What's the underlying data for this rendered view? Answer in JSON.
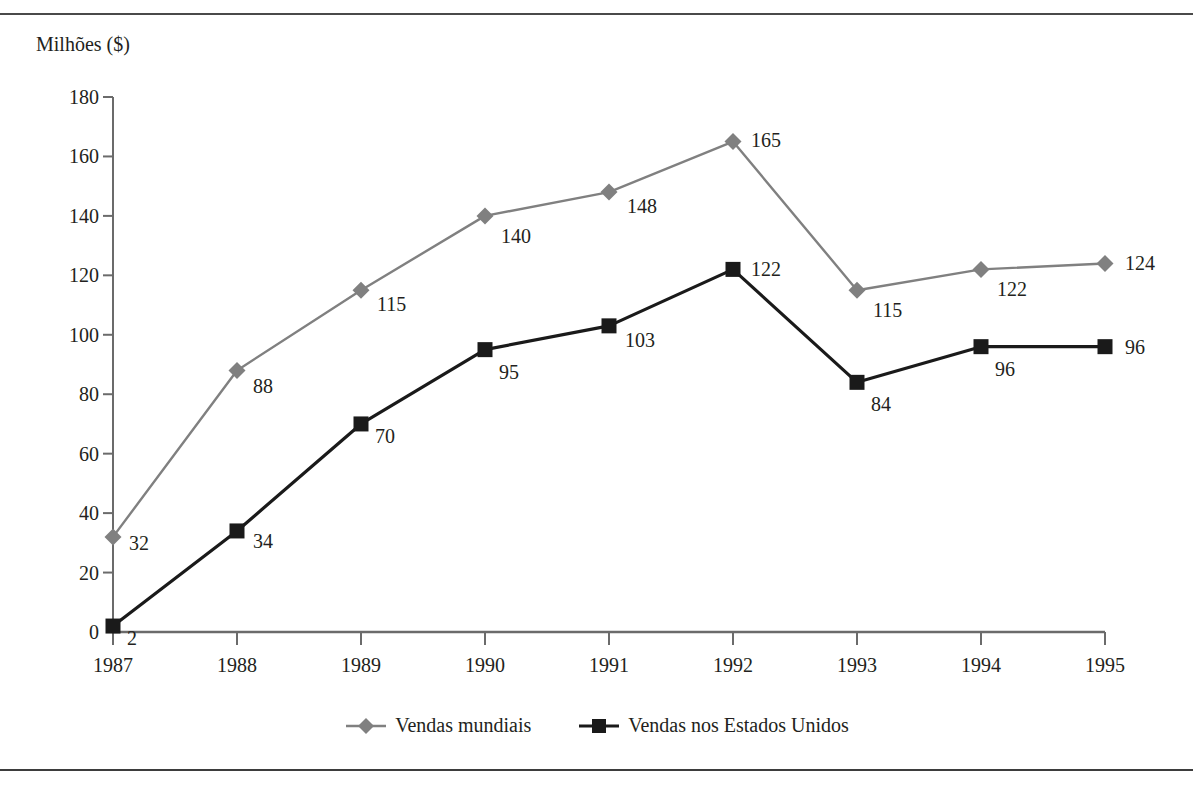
{
  "page": {
    "top_caption": "",
    "axis_title": "Milhões ($)"
  },
  "legend": {
    "items": [
      {
        "label": "Vendas mundiais",
        "marker": "diamond-marker-icon",
        "color": "#808080"
      },
      {
        "label": "Vendas nos Estados Unidos",
        "marker": "square-marker-icon",
        "color": "#1a1a1a"
      }
    ]
  },
  "chart_data": {
    "type": "line",
    "title": "",
    "xlabel": "",
    "ylabel": "Milhões ($)",
    "ylim": [
      0,
      180
    ],
    "ytick_step": 20,
    "yticks": [
      0,
      20,
      40,
      60,
      80,
      100,
      120,
      140,
      160,
      180
    ],
    "ytick_labels": [
      "0",
      "20",
      "40",
      "60",
      "80",
      "100",
      "120",
      "140",
      "160",
      "180"
    ],
    "grid": false,
    "legend_position": "bottom",
    "categories": [
      "1987",
      "1988",
      "1989",
      "1990",
      "1991",
      "1992",
      "1993",
      "1994",
      "1995"
    ],
    "series": [
      {
        "name": "Vendas mundiais",
        "color": "#808080",
        "marker": "diamond",
        "values": [
          32,
          88,
          115,
          140,
          148,
          165,
          115,
          122,
          124
        ],
        "labels": [
          "32",
          "88",
          "115",
          "140",
          "148",
          "165",
          "115",
          "122",
          "124"
        ],
        "label_offsets": [
          {
            "dx": 16,
            "dy": 6
          },
          {
            "dx": 16,
            "dy": 16
          },
          {
            "dx": 16,
            "dy": 14
          },
          {
            "dx": 16,
            "dy": 20
          },
          {
            "dx": 18,
            "dy": 14
          },
          {
            "dx": 18,
            "dy": -2
          },
          {
            "dx": 16,
            "dy": 20
          },
          {
            "dx": 16,
            "dy": 20
          },
          {
            "dx": 20,
            "dy": 0
          }
        ]
      },
      {
        "name": "Vendas nos Estados Unidos",
        "color": "#1a1a1a",
        "marker": "square",
        "values": [
          2,
          34,
          70,
          95,
          103,
          122,
          84,
          96,
          96
        ],
        "labels": [
          "2",
          "34",
          "70",
          "95",
          "103",
          "122",
          "84",
          "96",
          "96"
        ],
        "label_offsets": [
          {
            "dx": 14,
            "dy": 12
          },
          {
            "dx": 16,
            "dy": 10
          },
          {
            "dx": 14,
            "dy": 12
          },
          {
            "dx": 14,
            "dy": 22
          },
          {
            "dx": 16,
            "dy": 14
          },
          {
            "dx": 18,
            "dy": 0
          },
          {
            "dx": 14,
            "dy": 22
          },
          {
            "dx": 14,
            "dy": 22
          },
          {
            "dx": 20,
            "dy": 0
          }
        ]
      }
    ]
  }
}
